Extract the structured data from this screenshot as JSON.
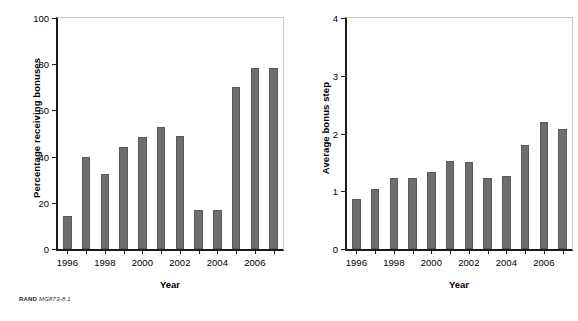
{
  "figure": {
    "credit_prefix": "RAND",
    "credit_code": "MG873-8.1",
    "bar_color": "#6e6e6e",
    "axis_color": "#1a1a1a",
    "frame_color": "#c9c9c9",
    "background": "#ffffff"
  },
  "chart_data": [
    {
      "type": "bar",
      "title": "",
      "xlabel": "Year",
      "ylabel": "Percentage receiving bonuses",
      "categories": [
        "1996",
        "1997",
        "1998",
        "1999",
        "2000",
        "2001",
        "2002",
        "2003",
        "2004",
        "2005",
        "2006",
        "2007"
      ],
      "tick_labels": [
        "1996",
        "",
        "1998",
        "",
        "2000",
        "",
        "2002",
        "",
        "2004",
        "",
        "2006",
        ""
      ],
      "values": [
        14.5,
        40,
        32.5,
        44,
        48.5,
        53,
        49,
        17,
        17,
        70,
        78.5,
        78.5
      ],
      "ylim": [
        0,
        100
      ],
      "yticks": [
        0,
        20,
        40,
        60,
        80,
        100
      ],
      "ytick_labels": [
        "0",
        "20",
        "40",
        "60",
        "80",
        "100"
      ],
      "grid": false,
      "legend": false
    },
    {
      "type": "bar",
      "title": "",
      "xlabel": "Year",
      "ylabel": "Average bonus step",
      "categories": [
        "1996",
        "1997",
        "1998",
        "1999",
        "2000",
        "2001",
        "2002",
        "2003",
        "2004",
        "2005",
        "2006",
        "2007"
      ],
      "tick_labels": [
        "1996",
        "",
        "1998",
        "",
        "2000",
        "",
        "2002",
        "",
        "2004",
        "",
        "2006",
        ""
      ],
      "values": [
        0.87,
        1.04,
        1.23,
        1.23,
        1.33,
        1.53,
        1.51,
        1.23,
        1.26,
        1.8,
        2.2,
        2.07
      ],
      "ylim": [
        0,
        4
      ],
      "yticks": [
        0,
        1,
        2,
        3,
        4
      ],
      "ytick_labels": [
        "0",
        "1",
        "2",
        "3",
        "4"
      ],
      "grid": false,
      "legend": false
    }
  ]
}
